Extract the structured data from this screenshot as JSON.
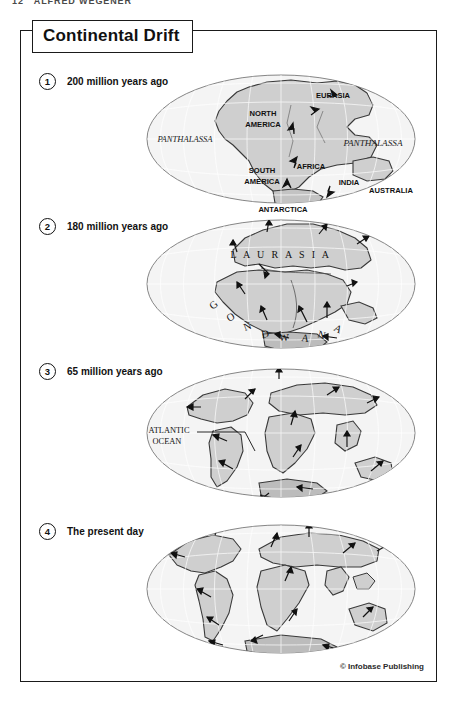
{
  "page_header": {
    "folio": "12",
    "running_title": "ALFRED WEGENER"
  },
  "figure": {
    "title": "Continental Drift",
    "credit": "© Infobase Publishing"
  },
  "panels": [
    {
      "number": "1",
      "caption": "200 million years ago",
      "map_labels": {
        "ocean_left": "PANTHALASSA",
        "ocean_right": "PANTHALASSA",
        "north_america_1": "NORTH",
        "north_america_2": "AMERICA",
        "south_america_1": "SOUTH",
        "south_america_2": "AMERICA",
        "eurasia": "EURASIA",
        "africa": "AFRICA",
        "india": "INDIA",
        "australia": "AUSTRALIA",
        "antarctica": "ANTARCTICA"
      }
    },
    {
      "number": "2",
      "caption": "180 million years ago",
      "map_labels": {
        "laurasia": "L A U R A S I A",
        "gondwana": [
          "G",
          "O",
          "N",
          "D",
          "W",
          "A",
          "N",
          "A"
        ]
      }
    },
    {
      "number": "3",
      "caption": "65 million years ago",
      "map_labels": {
        "ocean_1": "ATLANTIC",
        "ocean_2": "OCEAN"
      }
    },
    {
      "number": "4",
      "caption": "The present day",
      "map_labels": {}
    }
  ],
  "colors": {
    "frame": "#1a1a1a",
    "land_fill": "#cfcfcf",
    "land_stroke": "#3a3a3a",
    "graticule": "#ffffff",
    "ocean_fill": "#f3f3f3",
    "ellipse_stroke": "#6e6e6e",
    "text": "#111111"
  }
}
